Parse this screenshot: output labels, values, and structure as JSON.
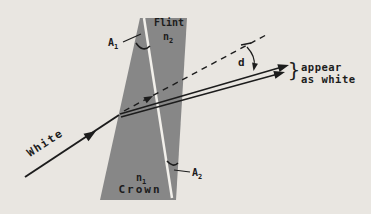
{
  "colors": {
    "paper": "#e9e6e1",
    "prism_gray": "#878787",
    "ink": "#1c1c1c",
    "divider_white": "#f2f0eb"
  },
  "flint": {
    "material": "Flint",
    "index_base": "n",
    "index_sub": "2"
  },
  "crown": {
    "material": "Crown",
    "index_base": "n",
    "index_sub": "1"
  },
  "angles": {
    "a1_base": "A",
    "a1_sub": "1",
    "a2_base": "A",
    "a2_sub": "2"
  },
  "rays": {
    "incident": "White",
    "deviation": "d",
    "brace": "}",
    "result_line1": "appear",
    "result_line2": "as white"
  }
}
